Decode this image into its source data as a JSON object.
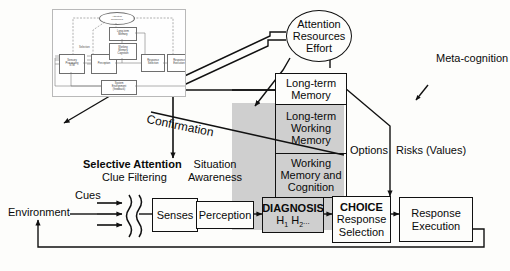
{
  "diagram": {
    "ellipse": {
      "line1": "Attention",
      "line2": "Resources",
      "line3": "Effort"
    },
    "boxes": {
      "long_term_memory": "Long-term\nMemory",
      "ltwm_line1": "Long-term",
      "ltwm_line2": "Working",
      "ltwm_line3": "Memory",
      "wmc_line1": "Working",
      "wmc_line2": "Memory and",
      "wmc_line3": "Cognition",
      "diagnosis_title": "DIAGNOSIS",
      "diagnosis_sub_h1": "H",
      "diagnosis_sub_1": "1",
      "diagnosis_sub_h2": "H",
      "diagnosis_sub_2": "2",
      "diagnosis_ellipsis": "...",
      "senses": "Senses",
      "perception": "Perception",
      "choice_title": "CHOICE",
      "choice_line2": "Response",
      "choice_line3": "Selection",
      "response_exec_line1": "Response",
      "response_exec_line2": "Execution"
    },
    "labels": {
      "meta_cognition": "Meta-cognition",
      "confirmation": "Confirmation",
      "selective_attention": "Selective Attention",
      "clue_filtering": "Clue Filtering",
      "situation": "Situation",
      "awareness": "Awareness",
      "options": "Options",
      "risks": "Risks (Values)",
      "cues": "Cues",
      "environment": "Environment"
    },
    "inset": {
      "caption": "Wickens human information processing model (inset)",
      "ellipse": "Attention\nResources",
      "boxes": [
        "Sensory\nProcessing\nSTM",
        "Perception",
        "Long-term\nMemory",
        "Working\nMemory\nCognition",
        "Response\nSelection",
        "Response\nExecution",
        "System\nEnvironment\n(feedback)"
      ],
      "label_selection": "Selection"
    },
    "colors": {
      "gray_panel": "#cfcfcf",
      "stroke": "#111111",
      "background": "#fdfdfb"
    }
  }
}
